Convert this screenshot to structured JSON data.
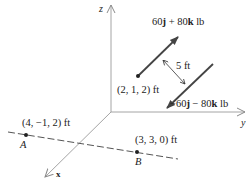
{
  "figure": {
    "axes": {
      "z_label": "z",
      "y_label": "y",
      "x_label": "x"
    },
    "forces": {
      "upper": {
        "label_prefix": "60",
        "j": "j",
        "plus": " + 80",
        "k": "k",
        "unit": " lb"
      },
      "lower": {
        "label_prefix": "−60",
        "j": "j",
        "minus": " − 80",
        "k": "k",
        "unit": " lb"
      },
      "application_point": "(2, 1, 2) ft",
      "separation": "5 ft"
    },
    "line_AB": {
      "point_A": {
        "name": "A",
        "coords": "(4, −1, 2) ft"
      },
      "point_B": {
        "name": "B",
        "coords": "(3, 3, 0) ft"
      }
    },
    "colors": {
      "force_arrow": "#444444",
      "axis_line": "#9a9a9a",
      "dashed_line": "#555555",
      "text": "#222222"
    }
  }
}
